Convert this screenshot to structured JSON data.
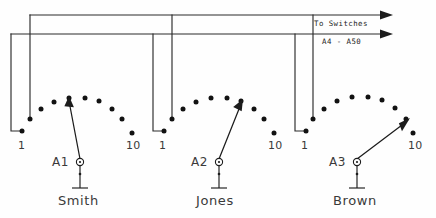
{
  "diagram": {
    "canvas": {
      "width": 436,
      "height": 218
    },
    "ink_color": "#1c1c1c",
    "background_color": "#fefefe"
  },
  "bus_annotations": {
    "to_switches_label": "To Switches",
    "switch_range_label": "A4 - A50"
  },
  "banks": [
    {
      "selector_id": "A1",
      "subscriber_name": "Smith",
      "first_terminal_label": "1",
      "last_terminal_label": "10",
      "wiper_position": 3,
      "contact_count": 10
    },
    {
      "selector_id": "A2",
      "subscriber_name": "Jones",
      "first_terminal_label": "1",
      "last_terminal_label": "10",
      "wiper_position": 6,
      "contact_count": 10
    },
    {
      "selector_id": "A3",
      "subscriber_name": "Brown",
      "first_terminal_label": "1",
      "last_terminal_label": "10",
      "wiper_position": 9,
      "contact_count": 10
    }
  ]
}
